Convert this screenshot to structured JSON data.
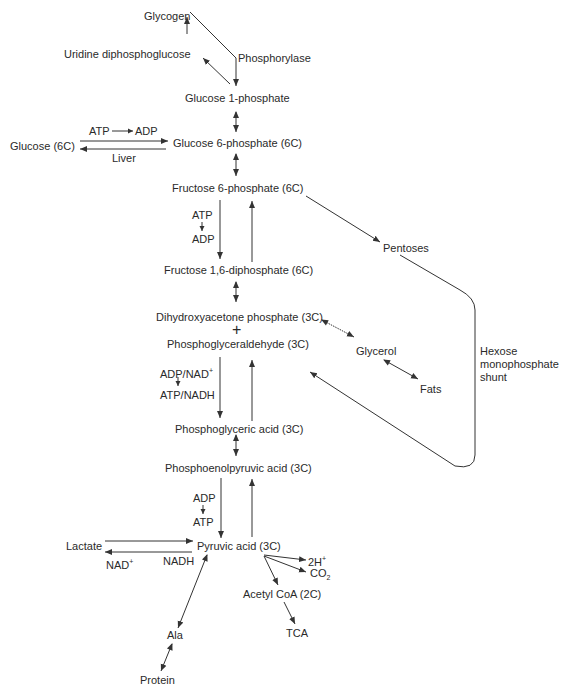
{
  "diagram": {
    "nodes": {
      "glycogen": "Glycogen",
      "udpg": "Uridine diphosphoglucose",
      "phosphorylase": "Phosphorylase",
      "g1p": "Glucose 1-phosphate",
      "glucose": "Glucose (6C)",
      "g6p": "Glucose 6-phosphate (6C)",
      "atp1": "ATP",
      "adp1": "ADP",
      "liver": "Liver",
      "f6p": "Fructose 6-phosphate (6C)",
      "atp2": "ATP",
      "adp2": "ADP",
      "pentoses": "Pentoses",
      "f16dp": "Fructose 1,6-diphosphate (6C)",
      "dhap": "Dihydroxyacetone phosphate (3C)",
      "plus": "+",
      "pgald": "Phosphoglyceraldehyde (3C)",
      "glycerol": "Glycerol",
      "fats": "Fats",
      "hmp1": "Hexose",
      "hmp2": "monophosphate",
      "hmp3": "shunt",
      "adpnad": "ADP/NAD",
      "adpnad_sup": "+",
      "atpnadh": "ATP/NADH",
      "pga": "Phosphoglyceric acid (3C)",
      "pep": "Phosphoenolpyruvic acid (3C)",
      "adp3": "ADP",
      "atp3": "ATP",
      "lactate": "Lactate",
      "pyruvate": "Pyruvic acid (3C)",
      "nad": "NAD",
      "nad_sup": "+",
      "nadh": "NADH",
      "h2": "2H",
      "h2_sup": "+",
      "co2": "CO",
      "co2_sub": "2",
      "acetylcoa": "Acetyl CoA (2C)",
      "tca": "TCA",
      "ala": "Ala",
      "protein": "Protein"
    }
  }
}
